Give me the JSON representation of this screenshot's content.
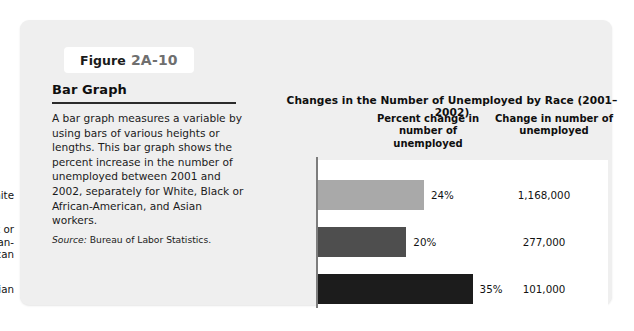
{
  "figure": {
    "label_word": "Figure",
    "number": "2A-10",
    "heading": "Bar Graph",
    "body": "A bar graph measures a variable by using bars of various heights or lengths. This bar graph shows the percent increase in the number of unemployed between 2001 and 2002, separately for White, Black or African-American, and Asian workers.",
    "source_label": "Source:",
    "source_text": "Bureau of Labor Statistics."
  },
  "chart_data": {
    "type": "bar",
    "orientation": "horizontal",
    "title": "Changes in the Number of Unemployed by Race (2001–2002)",
    "column_headers": [
      "Percent change in number of unemployed",
      "Change in number of unemployed"
    ],
    "categories": [
      "White",
      "Black or African-American",
      "Asian"
    ],
    "category_lines": [
      [
        "White"
      ],
      [
        "Black or",
        "African-",
        "American"
      ],
      [
        "Asian"
      ]
    ],
    "values": [
      24,
      20,
      35
    ],
    "value_labels": [
      "24%",
      "20%",
      "35%"
    ],
    "counts": [
      1168000,
      277000,
      101000
    ],
    "count_labels": [
      "1,168,000",
      "277,000",
      "101,000"
    ],
    "bar_colors": [
      "#a9a9a9",
      "#4e4e4e",
      "#1c1c1c"
    ],
    "xlabel": "",
    "ylabel": "",
    "xlim": [
      0,
      40
    ],
    "grid": false,
    "legend": "none"
  },
  "style": {
    "panel_background": "#efefef",
    "plot_background": "#ffffff",
    "axis_color": "#7d7d7d",
    "text_color": "#121212"
  }
}
